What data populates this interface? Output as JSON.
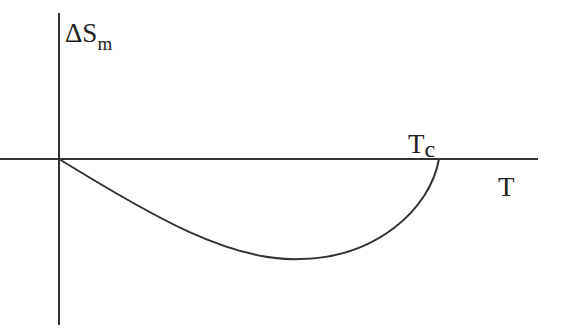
{
  "diagram": {
    "y_axis_label": {
      "main": "ΔS",
      "sub": "m"
    },
    "x_axis_label": "T",
    "critical_point_label": {
      "main": "T",
      "sub": "c"
    },
    "curve_description": "negative bowl-shaped curve from origin to Tc"
  }
}
